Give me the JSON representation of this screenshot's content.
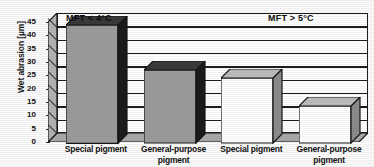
{
  "chart_data": {
    "type": "bar",
    "title": "",
    "xlabel": "",
    "ylabel": "Wet abrasion [µm]",
    "ylim": [
      0,
      45
    ],
    "ytick_step": 5,
    "yticks": [
      "0",
      "5",
      "10",
      "15",
      "20",
      "25",
      "30",
      "35",
      "40",
      "45"
    ],
    "grid": true,
    "legend": "none",
    "three_d": true,
    "categories": [
      "Special pigment",
      "General-purpose pigment",
      "Special pigment",
      "General-purpose pigment"
    ],
    "values": [
      44,
      27,
      24,
      13.5
    ],
    "bar_styles": [
      "filled-gray",
      "filled-gray",
      "white",
      "white"
    ],
    "annotations": [
      {
        "text": "MFT < 4°C",
        "position": "top-left",
        "group": [
          0,
          1
        ]
      },
      {
        "text": "MFT > 5°C",
        "position": "top-right",
        "group": [
          2,
          3
        ]
      }
    ]
  },
  "axis": {
    "y_title": "Wet abrasion [µm]",
    "ticks": [
      {
        "label": "45",
        "value": 45
      },
      {
        "label": "40",
        "value": 40
      },
      {
        "label": "35",
        "value": 35
      },
      {
        "label": "30",
        "value": 30
      },
      {
        "label": "25",
        "value": 25
      },
      {
        "label": "20",
        "value": 20
      },
      {
        "label": "15",
        "value": 15
      },
      {
        "label": "10",
        "value": 10
      },
      {
        "label": "5",
        "value": 5
      },
      {
        "label": "0",
        "value": 0
      }
    ]
  },
  "annotations": {
    "left": "MFT < 4°C",
    "left_prefix": "MFT < ",
    "left_value": "4°C",
    "right": "MFT > 5°C"
  },
  "categories": [
    {
      "line1": "Special pigment",
      "line2": ""
    },
    {
      "line1": "General-purpose",
      "line2": "pigment"
    },
    {
      "line1": "Special pigment",
      "line2": ""
    },
    {
      "line1": "General-purpose",
      "line2": "pigment"
    }
  ],
  "colors": {
    "bar_fill_gray": "#9c9c9c",
    "bar_fill_white": "#ffffff",
    "bar_side_dark": "#1b1b1b",
    "bar_side_gray": "#8c8c8c",
    "bar_top_dark": "#3a3a3a",
    "bar_top_gray": "#bdbdbd",
    "outline": "#161616",
    "floor": "#a8a8a8",
    "wall": "#ffffff",
    "text": "#111111"
  }
}
